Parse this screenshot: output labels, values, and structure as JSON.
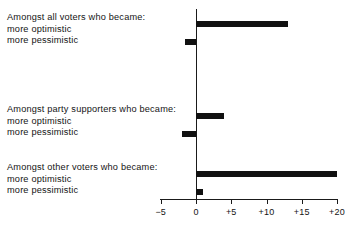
{
  "chart_data": {
    "type": "bar",
    "orientation": "horizontal",
    "title": "",
    "xlabel": "",
    "ylabel": "",
    "xlim": [
      -5,
      20
    ],
    "grid": false,
    "legend": "none",
    "tick_labels": [
      "−5",
      "0",
      "+5",
      "+10",
      "+15",
      "+20"
    ],
    "tick_values": [
      -5,
      0,
      5,
      10,
      15,
      20
    ],
    "bar_color": "#111111",
    "axis_color": "#1a1a1a",
    "groups": [
      {
        "heading": "Amongst all voters who became:",
        "categories": [
          "more optimistic",
          "more pessimistic"
        ],
        "values": [
          13,
          -1.5
        ]
      },
      {
        "heading": "Amongst party supporters who became:",
        "categories": [
          "more optimistic",
          "more pessimistic"
        ],
        "values": [
          4,
          -2
        ]
      },
      {
        "heading": "Amongst other voters who became:",
        "categories": [
          "more optimistic",
          "more pessimistic"
        ],
        "values": [
          20,
          1
        ]
      }
    ]
  },
  "labels": {
    "group_0": {
      "heading": "Amongst all voters who became:",
      "row_0": "more optimistic",
      "row_1": "more pessimistic"
    },
    "group_1": {
      "heading": "Amongst party supporters who became:",
      "row_0": "more optimistic",
      "row_1": "more pessimistic"
    },
    "group_2": {
      "heading": "Amongst other voters who became:",
      "row_0": "more optimistic",
      "row_1": "more pessimistic"
    }
  },
  "axis": {
    "t0": "−5",
    "t1": "0",
    "t2": "+5",
    "t3": "+10",
    "t4": "+15",
    "t5": "+20"
  }
}
